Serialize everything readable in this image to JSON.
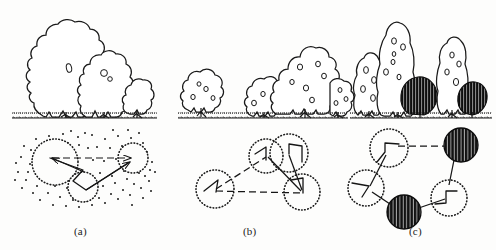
{
  "figure": {
    "background_color": "#fdfdfc",
    "ink_color": "#1a1a1a",
    "panels": [
      {
        "id": "a",
        "label": "(a)",
        "elevation": {
          "description": "Three broadleaf tree silhouettes in outline on a grass ground line: two large overlapping trees at left and one small tree at right",
          "tree_count": 3,
          "fill": "white",
          "texture": "plain outline with a few small leaf marks"
        },
        "plan": {
          "description": "Plan view: three dotted-outline circles linked by solid arrow lines, set in a dense scatter of dots",
          "circle_count": 3,
          "filled_circle_count": 0,
          "dot_scatter": true,
          "link_style": "arrow"
        }
      },
      {
        "id": "b",
        "label": "(b)",
        "elevation": {
          "description": "Three trees in outline with small spot foliage texture: one small tree at left, a tall tree and a medium tree grouped at right",
          "tree_count": 3,
          "fill": "white",
          "texture": "outline with small oval leaf spots"
        },
        "plan": {
          "description": "Plan view: four dotted-outline circles connected by dashed lines forming a triangular network, two circles overlapping at the top",
          "circle_count": 4,
          "filled_circle_count": 0,
          "dot_scatter": false,
          "link_style": "dashed"
        }
      },
      {
        "id": "c",
        "label": "(c)",
        "elevation": {
          "description": "Four columnar trees in outline with leaf spots plus two dark vertically hatched shrubs",
          "tree_count": 4,
          "fill": "white and solid dark hatch",
          "texture": "outline with leaf spots; dark vertical hatching on shrubs"
        },
        "plan": {
          "description": "Plan view: five circles connected by dashed lines, three dotted outline and two filled with dark vertical hatching",
          "circle_count": 5,
          "filled_circle_count": 2,
          "dot_scatter": false,
          "link_style": "dashed"
        }
      }
    ]
  }
}
